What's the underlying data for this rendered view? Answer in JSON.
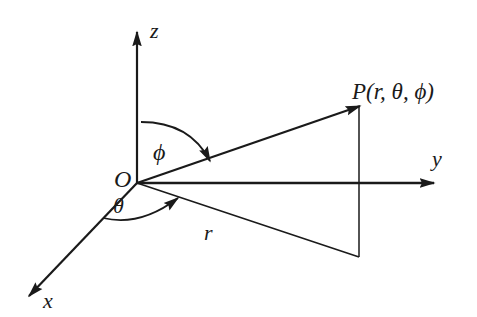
{
  "diagram": {
    "colors": {
      "ink": "#1a1a1a",
      "background": "#ffffff"
    },
    "axes": [
      {
        "name": "z",
        "label": "z"
      },
      {
        "name": "y",
        "label": "y"
      },
      {
        "name": "x",
        "label": "x"
      }
    ],
    "origin_label": "O",
    "point_label": "P(r, θ, ϕ)",
    "radius_label": "r",
    "angles": {
      "polar": {
        "symbol": "ϕ",
        "between": "z-axis and OP"
      },
      "azimuth": {
        "symbol": "θ",
        "between": "x-axis and projection of OP"
      }
    }
  }
}
